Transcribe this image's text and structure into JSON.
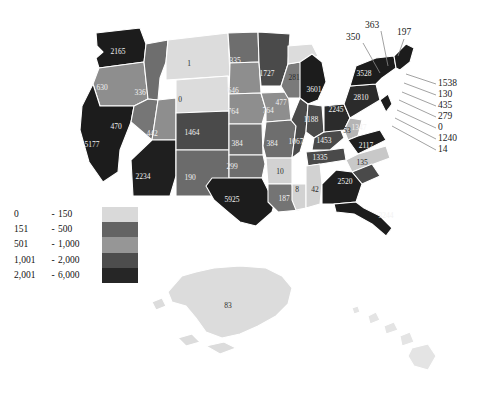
{
  "map": {
    "title": "United States choropleth map",
    "legend": {
      "rows": [
        {
          "low": "0",
          "dash": "-",
          "high": "150",
          "color": "#d9d9d9"
        },
        {
          "low": "151",
          "dash": "-",
          "high": "500",
          "color": "#636363"
        },
        {
          "low": "501",
          "dash": "-",
          "high": "1,000",
          "color": "#969696"
        },
        {
          "low": "1,001",
          "dash": "-",
          "high": "2,000",
          "color": "#4d4d4d"
        },
        {
          "low": "2,001",
          "dash": "-",
          "high": "6,000",
          "color": "#262626"
        }
      ]
    },
    "states": [
      {
        "id": "WA",
        "value": "2165",
        "color": "#1c1c1c",
        "label_class": "lbl-light",
        "lx": 118,
        "ly": 52
      },
      {
        "id": "OR",
        "value": "630",
        "color": "#8e8e8e",
        "label_class": "lbl-light",
        "lx": 102,
        "ly": 88
      },
      {
        "id": "CA",
        "value": "5177",
        "color": "#1c1c1c",
        "label_class": "lbl-light",
        "lx": 92,
        "ly": 145
      },
      {
        "id": "ID",
        "value": "336",
        "color": "#6e6e6e",
        "label_class": "lbl-light",
        "lx": 140,
        "ly": 93
      },
      {
        "id": "NV",
        "value": "470",
        "color": "#767676",
        "label_class": "lbl-light",
        "lx": 116,
        "ly": 127
      },
      {
        "id": "UT",
        "value": "442",
        "color": "#8e8e8e",
        "label_class": "lbl-light",
        "lx": 152,
        "ly": 134
      },
      {
        "id": "AZ",
        "value": "2234",
        "color": "#1f1f1f",
        "label_class": "lbl-light",
        "lx": 143,
        "ly": 177
      },
      {
        "id": "MT",
        "value": "1",
        "color": "#dcdcdc",
        "label_class": "lbl-dark",
        "lx": 189,
        "ly": 64
      },
      {
        "id": "WY",
        "value": "0",
        "color": "#dcdcdc",
        "label_class": "lbl-dark",
        "lx": 180,
        "ly": 100
      },
      {
        "id": "CO",
        "value": "1464",
        "color": "#4a4a4a",
        "label_class": "lbl-light",
        "lx": 192,
        "ly": 133
      },
      {
        "id": "NM",
        "value": "190",
        "color": "#6b6b6b",
        "label_class": "lbl-light",
        "lx": 190,
        "ly": 178
      },
      {
        "id": "ND",
        "value": "335",
        "color": "#6e6e6e",
        "label_class": "lbl-light",
        "lx": 235,
        "ly": 61
      },
      {
        "id": "SD",
        "value": "646",
        "color": "#8e8e8e",
        "label_class": "lbl-light",
        "lx": 233,
        "ly": 91
      },
      {
        "id": "NE",
        "value": "764",
        "color": "#8e8e8e",
        "label_class": "lbl-light",
        "lx": 233,
        "ly": 112
      },
      {
        "id": "KS",
        "value": "384",
        "color": "#6e6e6e",
        "label_class": "lbl-light",
        "lx": 237,
        "ly": 144
      },
      {
        "id": "OK",
        "value": "299",
        "color": "#6e6e6e",
        "label_class": "lbl-light",
        "lx": 232,
        "ly": 167
      },
      {
        "id": "TX",
        "value": "5925",
        "color": "#1c1c1c",
        "label_class": "lbl-light",
        "lx": 232,
        "ly": 200
      },
      {
        "id": "MN",
        "value": "1727",
        "color": "#4a4a4a",
        "label_class": "lbl-light",
        "lx": 267,
        "ly": 74
      },
      {
        "id": "IA",
        "value": "764",
        "color": "#8e8e8e",
        "label_class": "lbl-light",
        "lx": 268,
        "ly": 111
      },
      {
        "id": "MO",
        "value": "384",
        "color": "#6e6e6e",
        "label_class": "lbl-light",
        "lx": 272,
        "ly": 144
      },
      {
        "id": "AR",
        "value": "10",
        "color": "#d2d2d2",
        "label_class": "lbl-dark",
        "lx": 280,
        "ly": 172
      },
      {
        "id": "LA",
        "value": "187",
        "color": "#747474",
        "label_class": "lbl-light",
        "lx": 284,
        "ly": 199
      },
      {
        "id": "WI",
        "value": "477",
        "color": "#7a7a7a",
        "label_class": "lbl-light",
        "lx": 281,
        "ly": 103
      },
      {
        "id": "MI-UP",
        "value": "281",
        "color": "#dcdcdc",
        "label_class": "lbl-dark",
        "lx": 294,
        "ly": 78
      },
      {
        "id": "IL",
        "value": "1067",
        "color": "#4a4a4a",
        "label_class": "lbl-light",
        "lx": 296,
        "ly": 142
      },
      {
        "id": "MS",
        "value": "8",
        "color": "#d2d2d2",
        "label_class": "lbl-dark",
        "lx": 297,
        "ly": 190
      },
      {
        "id": "MI",
        "value": "3601",
        "color": "#1c1c1c",
        "label_class": "lbl-light",
        "lx": 314,
        "ly": 90
      },
      {
        "id": "IN",
        "value": "1188",
        "color": "#4a4a4a",
        "label_class": "lbl-light",
        "lx": 311,
        "ly": 120
      },
      {
        "id": "KY",
        "value": "1453",
        "color": "#4a4a4a",
        "label_class": "lbl-light",
        "lx": 324,
        "ly": 141
      },
      {
        "id": "TN",
        "value": "1335",
        "color": "#4a4a4a",
        "label_class": "lbl-light",
        "lx": 320,
        "ly": 158
      },
      {
        "id": "AL",
        "value": "42",
        "color": "#d2d2d2",
        "label_class": "lbl-dark",
        "lx": 315,
        "ly": 190
      },
      {
        "id": "OH",
        "value": "2245",
        "color": "#2b2b2b",
        "label_class": "lbl-light",
        "lx": 336,
        "ly": 110
      },
      {
        "id": "WV",
        "value": "53",
        "color": "#b5b5b5",
        "label_class": "lbl-dark",
        "lx": 347,
        "ly": 131
      },
      {
        "id": "VA",
        "value": "2117",
        "color": "#1f1f1f",
        "label_class": "lbl-light",
        "lx": 366,
        "ly": 146
      },
      {
        "id": "NC",
        "value": "135",
        "color": "#c8c8c8",
        "label_class": "lbl-dark",
        "lx": 362,
        "ly": 163
      },
      {
        "id": "SC",
        "value": "1347",
        "color": "#4a4a4a",
        "label_class": "lbl-light",
        "lx": 359,
        "ly": 128
      },
      {
        "id": "GA",
        "value": "2520",
        "color": "#1f1f1f",
        "label_class": "lbl-light",
        "lx": 345,
        "ly": 182
      },
      {
        "id": "FL",
        "value": "3244",
        "color": "#1c1c1c",
        "label_class": "lbl-light",
        "lx": 386,
        "ly": 216
      },
      {
        "id": "PA",
        "value": "2810",
        "color": "#2b2b2b",
        "label_class": "lbl-light",
        "lx": 361,
        "ly": 98
      },
      {
        "id": "NY",
        "value": "3528",
        "color": "#1c1c1c",
        "label_class": "lbl-light",
        "lx": 364,
        "ly": 74
      },
      {
        "id": "AK",
        "value": "83",
        "color": "#dcdcdc",
        "label_class": "lbl-dark",
        "lx": 228,
        "ly": 306
      },
      {
        "id": "HI",
        "value": "",
        "color": "#e4e4e4",
        "label_class": "lbl-dark",
        "lx": 0,
        "ly": 0
      }
    ],
    "callouts_top": [
      {
        "value": "350",
        "tx": 353,
        "ty": 38,
        "x1": 363,
        "y1": 43,
        "x2": 380,
        "y2": 73
      },
      {
        "value": "363",
        "tx": 372,
        "ty": 26,
        "x1": 381,
        "y1": 31,
        "x2": 388,
        "y2": 66
      },
      {
        "value": "197",
        "tx": 404,
        "ty": 33,
        "x1": 404,
        "y1": 39,
        "x2": 398,
        "y2": 56
      }
    ],
    "callouts_right": [
      {
        "value": "1538",
        "tx": 438,
        "ty": 84,
        "x1": 436,
        "y1": 84,
        "x2": 406,
        "y2": 74
      },
      {
        "value": "130",
        "tx": 438,
        "ty": 95,
        "x1": 436,
        "y1": 95,
        "x2": 404,
        "y2": 83
      },
      {
        "value": "435",
        "tx": 438,
        "ty": 106,
        "x1": 436,
        "y1": 106,
        "x2": 402,
        "y2": 92
      },
      {
        "value": "279",
        "tx": 438,
        "ty": 117,
        "x1": 436,
        "y1": 117,
        "x2": 399,
        "y2": 100
      },
      {
        "value": "0",
        "tx": 438,
        "ty": 128,
        "x1": 436,
        "y1": 128,
        "x2": 397,
        "y2": 110
      },
      {
        "value": "1240",
        "tx": 438,
        "ty": 139,
        "x1": 436,
        "y1": 139,
        "x2": 395,
        "y2": 118
      },
      {
        "value": "14",
        "tx": 438,
        "ty": 150,
        "x1": 436,
        "y1": 150,
        "x2": 392,
        "y2": 126
      }
    ]
  }
}
